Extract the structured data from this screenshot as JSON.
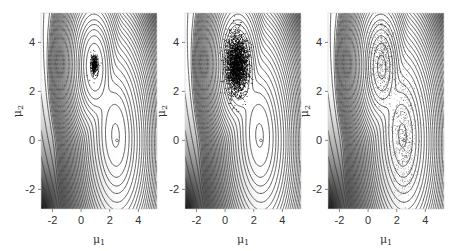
{
  "figure": {
    "panel_count": 3,
    "background": "#ffffff",
    "contour_color": "#3a3a3a",
    "frame_color": "#cfcfcf"
  },
  "chart_data": [
    {
      "type": "contour",
      "panel": 1,
      "title": "",
      "xlabel": "μ1",
      "ylabel": "μ2",
      "xlim": [
        -2.8,
        5.3
      ],
      "ylim": [
        -2.8,
        5.2
      ],
      "xticks": [
        -2,
        0,
        2,
        4
      ],
      "yticks": [
        -2,
        0,
        2,
        4
      ],
      "grid": false,
      "modes": [
        {
          "mu1": 0.9,
          "mu2": 3.1,
          "label": "dominant mode"
        },
        {
          "mu1": 2.5,
          "mu2": 0.0,
          "label": "minor mode"
        }
      ],
      "samples": {
        "center": [
          0.9,
          3.1
        ],
        "spread": [
          0.12,
          0.18
        ],
        "count": 400,
        "description": "tight cluster at dominant mode"
      },
      "marker": {
        "mu1": 2.5,
        "mu2": 0.0
      }
    },
    {
      "type": "contour",
      "panel": 2,
      "title": "",
      "xlabel": "μ1",
      "ylabel": "μ2",
      "xlim": [
        -2.8,
        5.3
      ],
      "ylim": [
        -2.8,
        5.2
      ],
      "xticks": [
        -2,
        0,
        2,
        4
      ],
      "yticks": [
        -2,
        0,
        2,
        4
      ],
      "grid": false,
      "samples": {
        "center": [
          0.8,
          3.1
        ],
        "spread": [
          0.38,
          0.6
        ],
        "count": 2500,
        "description": "dense cloud filling the upper mode"
      },
      "marker": {
        "mu1": 2.5,
        "mu2": 0.0
      }
    },
    {
      "type": "contour",
      "panel": 3,
      "title": "",
      "xlabel": "μ1",
      "ylabel": "μ2",
      "xlim": [
        -2.8,
        5.3
      ],
      "ylim": [
        -2.8,
        5.2
      ],
      "xticks": [
        -2,
        0,
        2,
        4
      ],
      "yticks": [
        -2,
        0,
        2,
        4
      ],
      "grid": false,
      "samples": {
        "center": [
          1.6,
          1.6
        ],
        "spread": [
          0.8,
          2.0
        ],
        "count": 1400,
        "description": "sparse samples spread across both modes"
      },
      "marker": {
        "mu1": 2.5,
        "mu2": 0.0
      }
    }
  ],
  "axes": {
    "xlabel_main": "μ",
    "xlabel_sub": "1",
    "ylabel_main": "μ",
    "ylabel_sub": "2",
    "xtick_labels": [
      "-2",
      "0",
      "2",
      "4"
    ],
    "ytick_labels": [
      "-2",
      "0",
      "2",
      "4"
    ]
  }
}
